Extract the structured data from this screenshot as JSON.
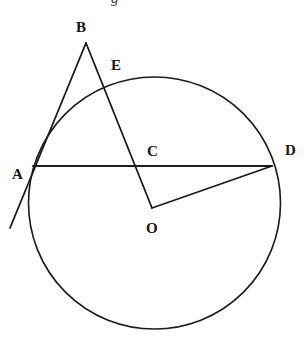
{
  "figure": {
    "caption_remnant": "g",
    "background_color": "#ffffff",
    "stroke_color": "#1a1a1a",
    "label_color": "#141414",
    "width": 305,
    "height": 338
  },
  "labels": {
    "a": "A",
    "b": "B",
    "c": "C",
    "d": "D",
    "e": "E",
    "o": "O"
  },
  "chart_data": {
    "type": "diagram",
    "subtype": "euclidean-circle-geometry",
    "title": "",
    "canvas": {
      "width": 305,
      "height": 338
    },
    "circle": {
      "name": "main-circle",
      "center": [
        154.5,
        203
      ],
      "radius": 126,
      "stroke": "#1a1a1a",
      "stroke_width": 1.6,
      "fill": "none"
    },
    "points": [
      {
        "id": "A",
        "label": "A",
        "x": 33,
        "y": 166,
        "on_circle": true,
        "label_x": 12,
        "label_y": 167
      },
      {
        "id": "B",
        "label": "B",
        "x": 86,
        "y": 43,
        "on_circle": false,
        "label_x": 76,
        "label_y": 20
      },
      {
        "id": "C",
        "label": "C",
        "x": 135,
        "y": 168,
        "on_circle": false,
        "label_x": 147,
        "label_y": 144
      },
      {
        "id": "D",
        "label": "D",
        "x": 272,
        "y": 166,
        "on_circle": true,
        "label_x": 285,
        "label_y": 143
      },
      {
        "id": "E",
        "label": "E",
        "x": 103,
        "y": 88,
        "on_circle": true,
        "label_x": 111,
        "label_y": 58
      },
      {
        "id": "O",
        "label": "O",
        "x": 152,
        "y": 208,
        "on_circle": false,
        "label_x": 146,
        "label_y": 221
      },
      {
        "id": "T",
        "label": "",
        "x": 10,
        "y": 228,
        "on_circle": false,
        "label_x": 0,
        "label_y": 0
      }
    ],
    "segments": [
      {
        "id": "BT",
        "from": "B",
        "to": "T",
        "description": "tangent-line-through-A-extended",
        "stroke_width": 1.8
      },
      {
        "id": "BO",
        "from": "B",
        "to": "O",
        "description": "secant-B-through-E-and-C-to-O",
        "stroke_width": 1.8
      },
      {
        "id": "AD",
        "from": "A",
        "to": "D",
        "description": "chord-A-to-D-through-C",
        "stroke_width": 1.8
      },
      {
        "id": "OD",
        "from": "O",
        "to": "D",
        "description": "radius-O-to-D",
        "stroke_width": 1.8
      }
    ],
    "notes": [
      "Line from B descends left through A and continues beyond the circle.",
      "Line from B descends right crossing the circle at E, crossing chord AD at C, ending at O.",
      "Chord AD is drawn horizontally across the circle from A to D.",
      "Segment OD joins the interior point O to circle point D."
    ]
  }
}
